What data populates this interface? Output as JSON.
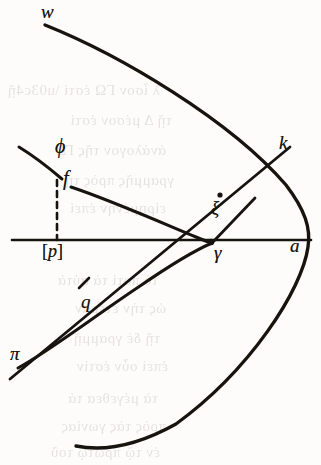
{
  "figure": {
    "ink_color": "#17140f",
    "paper_color": "#fdfcfa",
    "width": 321,
    "height": 465
  },
  "labels": {
    "w": "w",
    "k": "k",
    "phi": "ϕ",
    "f": "f",
    "xi": "ξ",
    "p": "p",
    "p_open": "[",
    "p_close": "]",
    "gamma": "γ",
    "a": "a",
    "q": "q",
    "pi": "π"
  },
  "geometry": {
    "axis": {
      "x1": 12,
      "y1": 240,
      "x2": 311,
      "y2": 240
    },
    "parabola_w_a": "M 45 25 C 120 55, 230 120, 286 185 C 305 210, 311 228, 308 247 C 302 290, 250 370, 176 424 C 140 444, 105 452, 76 446",
    "curve_f_gamma": "M 71 187 C 110 200, 160 222, 196 237 C 203 240, 208 242, 212 243",
    "curve_phi_f": "M 19 147 C 32 155, 48 167, 62 179",
    "curve_pi_gamma": "M 18 368 C 48 352, 92 318, 140 286 C 172 264, 198 249, 212 243",
    "line_q_k": "M 10 379 L 290 147",
    "line_xi_gamma": "M 212 243 L 255 198",
    "dashed_drop": {
      "x": 57,
      "y1": 180,
      "y2": 240
    },
    "tick_q": {
      "x": 84,
      "y": 283
    },
    "dot_xi": {
      "cx": 220,
      "cy": 195,
      "r": 2.6
    },
    "dot_gamma": {
      "cx": 211,
      "cy": 242,
      "r": 3.2
    }
  },
  "background_showthrough": {
    "note": "faint mirrored print bleeding through from the reverse page",
    "lines": [
      {
        "text": "λ ἶσον ΓΩ ἐστί \\u03c4ῇ",
        "top": 82,
        "left": 160
      },
      {
        "text": "τῇ Δ μέσον ἐστί",
        "top": 112,
        "left": 172
      },
      {
        "text": "ἀνάλογον τῆς ΓΔ",
        "top": 142,
        "left": 166
      },
      {
        "text": "γραμμῆς πρὸς τὴ",
        "top": 172,
        "left": 174
      },
      {
        "text": "εἰρημένην ἐπεί",
        "top": 200,
        "left": 166
      },
      {
        "text": "τὸ ποτὶ τὰ αὐτὰ",
        "top": 272,
        "left": 158
      },
      {
        "text": "ὡς τὴν ἑτέραν",
        "top": 300,
        "left": 166
      },
      {
        "text": "τῇ δὲ γραμμῇ",
        "top": 330,
        "left": 160
      },
      {
        "text": "ἐπεὶ οὖν ἐστὶν",
        "top": 358,
        "left": 168
      },
      {
        "text": "τὰ μέγεθεα τά",
        "top": 390,
        "left": 158
      },
      {
        "text": "πρὸς τὰς γωνίας",
        "top": 418,
        "left": 166
      },
      {
        "text": "ἐν τῷ πρώτῳ τοῦ",
        "top": 444,
        "left": 160
      }
    ]
  }
}
